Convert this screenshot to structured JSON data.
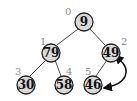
{
  "diagram": {
    "type": "binary-heap-tree",
    "colors": {
      "node_fill": "#d9d9d9",
      "node_stroke": "#222222",
      "index_label": "#8a8a8a",
      "arrow": "#111111"
    },
    "nodes": [
      {
        "index": "0",
        "value": "9"
      },
      {
        "index": "1",
        "value": "79"
      },
      {
        "index": "2",
        "value": "49"
      },
      {
        "index": "3",
        "value": "30"
      },
      {
        "index": "4",
        "value": "58"
      },
      {
        "index": "5",
        "value": "46"
      }
    ],
    "edges": [
      {
        "from": "0",
        "to": "1"
      },
      {
        "from": "0",
        "to": "2"
      },
      {
        "from": "1",
        "to": "3"
      },
      {
        "from": "1",
        "to": "4"
      },
      {
        "from": "2",
        "to": "5"
      }
    ],
    "swap_arrow": {
      "between": [
        "2",
        "5"
      ],
      "style": "double-headed-curved"
    }
  }
}
